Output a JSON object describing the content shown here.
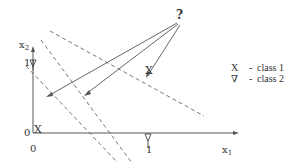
{
  "diagram": {
    "query_symbol": "?",
    "axes": {
      "x_label": "x",
      "x_sub": "1",
      "y_label": "x",
      "y_sub": "2",
      "x_tick_one": "1",
      "y_tick_one": "1",
      "origin_x": "0",
      "origin_y": "0"
    },
    "points": [
      {
        "symbol": "X",
        "class": "class 1",
        "position": "origin"
      },
      {
        "symbol": "X",
        "class": "class 1",
        "position": "(1,1)"
      },
      {
        "symbol": "∇",
        "class": "class 2",
        "position": "(0,1)"
      },
      {
        "symbol": "∇",
        "class": "class 2",
        "position": "(1,0)"
      }
    ],
    "legend": [
      {
        "symbol": "X",
        "dash": "-",
        "label": "class 1"
      },
      {
        "symbol": "∇",
        "dash": "-",
        "label": "class 2"
      }
    ],
    "colors": {
      "line": "#555555",
      "text": "#333333",
      "background": "#ffffff"
    }
  }
}
